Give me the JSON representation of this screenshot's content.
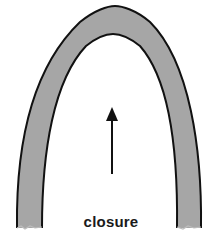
{
  "diagram": {
    "label": "closure",
    "colors": {
      "arch_fill": "#a6a6a6",
      "outline": "#111111",
      "background": "#ffffff"
    },
    "arrow_direction": "up"
  }
}
